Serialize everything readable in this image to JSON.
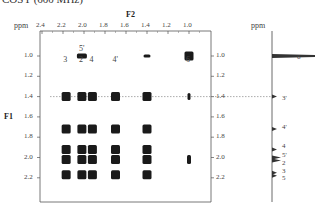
{
  "title": "COSY (600 MHz)",
  "chart_data": {
    "type": "heatmap",
    "subtype": "2D NMR COSY contour plot",
    "title": "COSY (600 MHz)",
    "xlabel": "F2",
    "ylabel": "F1",
    "x_unit": "ppm",
    "y_unit": "ppm",
    "xlim": [
      2.4,
      0.9
    ],
    "ylim": [
      0.9,
      2.4
    ],
    "x_ticks": [
      "2.4",
      "2.2",
      "2.0",
      "1.8",
      "1.6",
      "1.4",
      "1.2",
      "1.0"
    ],
    "y_ticks": [
      "1.0",
      "1.2",
      "1.4",
      "1.6",
      "1.8",
      "2.0",
      "2.2"
    ],
    "column_labels": [
      {
        "text": "3",
        "x": 2.17
      },
      {
        "text": "5'",
        "x": 2.02,
        "sub": "2"
      },
      {
        "text": "2",
        "x": 2.02
      },
      {
        "text": "4",
        "x": 1.92
      },
      {
        "text": "4'",
        "x": 1.7
      },
      {
        "text": "6",
        "x": 1.0
      }
    ],
    "reference_line_y": 1.4,
    "cross_peaks": [
      {
        "x": 2.02,
        "y": 1.0
      },
      {
        "x": 1.4,
        "y": 1.0
      },
      {
        "x": 1.0,
        "y": 1.0
      },
      {
        "x": 2.17,
        "y": 1.4
      },
      {
        "x": 2.02,
        "y": 1.4
      },
      {
        "x": 1.92,
        "y": 1.4
      },
      {
        "x": 1.7,
        "y": 1.4
      },
      {
        "x": 1.4,
        "y": 1.4
      },
      {
        "x": 1.0,
        "y": 1.4
      },
      {
        "x": 2.17,
        "y": 1.72
      },
      {
        "x": 2.02,
        "y": 1.72
      },
      {
        "x": 1.92,
        "y": 1.72
      },
      {
        "x": 1.7,
        "y": 1.72
      },
      {
        "x": 1.4,
        "y": 1.72
      },
      {
        "x": 2.17,
        "y": 1.92
      },
      {
        "x": 2.02,
        "y": 1.92
      },
      {
        "x": 1.92,
        "y": 1.92
      },
      {
        "x": 1.7,
        "y": 1.92
      },
      {
        "x": 1.4,
        "y": 1.92
      },
      {
        "x": 2.17,
        "y": 2.02
      },
      {
        "x": 2.02,
        "y": 2.02
      },
      {
        "x": 1.92,
        "y": 2.02
      },
      {
        "x": 1.7,
        "y": 2.02
      },
      {
        "x": 1.4,
        "y": 2.02
      },
      {
        "x": 1.0,
        "y": 2.02
      },
      {
        "x": 2.17,
        "y": 2.17
      },
      {
        "x": 2.02,
        "y": 2.17
      },
      {
        "x": 1.92,
        "y": 2.17
      },
      {
        "x": 1.7,
        "y": 2.17
      },
      {
        "x": 1.4,
        "y": 2.17
      }
    ],
    "projection_1d": {
      "axis": "F1",
      "peaks": [
        {
          "ppm": 1.0,
          "label": "6",
          "intensity": "very strong"
        },
        {
          "ppm": 1.4,
          "label": "3'",
          "intensity": "weak"
        },
        {
          "ppm": 1.72,
          "label": "4'",
          "intensity": "weak"
        },
        {
          "ppm": 1.92,
          "label": "4",
          "intensity": "weak"
        },
        {
          "ppm": 2.0,
          "label": "5'",
          "intensity": "medium"
        },
        {
          "ppm": 2.03,
          "label": "2",
          "intensity": "medium"
        },
        {
          "ppm": 2.15,
          "label": "3",
          "intensity": "weak"
        },
        {
          "ppm": 2.18,
          "label": "5",
          "intensity": "weak"
        }
      ]
    },
    "grid": false,
    "legend": "none"
  }
}
